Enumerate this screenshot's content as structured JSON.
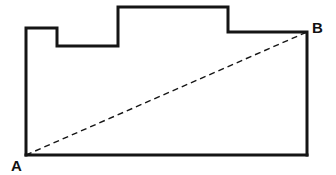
{
  "figure": {
    "background_color": "#ffffff",
    "outline_color": "#151515",
    "outline_width": 3,
    "diagonal_color": "#151515",
    "diagonal_width": 1.4,
    "diagonal_dash": "6 4",
    "canvas": {
      "width": 336,
      "height": 175
    }
  },
  "shape": {
    "name": "stepped-polygon",
    "points_attr": "26,155 26,28 57,28 57,46 118,46 118,7 228,7 228,32 307,32 307,155",
    "vertices": [
      {
        "name": "A",
        "x": 26,
        "y": 155
      },
      {
        "name": "v2",
        "x": 26,
        "y": 28
      },
      {
        "name": "v3",
        "x": 57,
        "y": 28
      },
      {
        "name": "v4",
        "x": 57,
        "y": 46
      },
      {
        "name": "v5",
        "x": 118,
        "y": 46
      },
      {
        "name": "v6",
        "x": 118,
        "y": 7
      },
      {
        "name": "v7",
        "x": 228,
        "y": 7
      },
      {
        "name": "v8",
        "x": 228,
        "y": 32
      },
      {
        "name": "B",
        "x": 307,
        "y": 32
      },
      {
        "name": "v10",
        "x": 307,
        "y": 155
      }
    ]
  },
  "diagonal": {
    "name": "A-to-B",
    "x1": 26,
    "y1": 155,
    "x2": 307,
    "y2": 32,
    "style": "dashed"
  },
  "labels": {
    "a": {
      "text": "A",
      "x": 11,
      "y": 171
    },
    "b": {
      "text": "B",
      "x": 312,
      "y": 33
    }
  }
}
